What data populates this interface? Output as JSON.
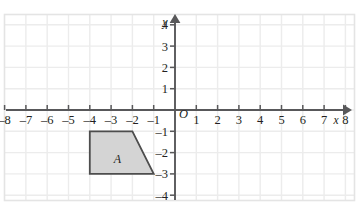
{
  "figure": {
    "type": "coordinate-plane",
    "background_color": "#ffffff",
    "frame_color": "#e2e2e2",
    "grid_color": "#ececec",
    "axis_color": "#58585a",
    "label_color": "#231f20"
  },
  "chart_data": {
    "type": "scatter",
    "title": "",
    "xlabel": "x",
    "ylabel": "y",
    "xlim": [
      -8.6,
      8.6
    ],
    "ylim": [
      -4.6,
      4.6
    ],
    "grid": true,
    "legend": "none",
    "x_ticks": [
      -8,
      -7,
      -6,
      -5,
      -4,
      -3,
      -2,
      -1,
      1,
      2,
      3,
      4,
      5,
      6,
      7,
      8
    ],
    "y_ticks": [
      4,
      3,
      2,
      1,
      -1,
      -2,
      -3,
      -4
    ],
    "x_tick_labels": [
      "–8",
      "–7",
      "–6",
      "–5",
      "–4",
      "–3",
      "–2",
      "–1",
      "1",
      "2",
      "3",
      "4",
      "5",
      "6",
      "7",
      "8"
    ],
    "y_tick_labels": [
      "4",
      "3",
      "2",
      "1",
      "–1",
      "–2",
      "–3",
      "–4"
    ],
    "origin_label": "O",
    "shapes": [
      {
        "name": "A",
        "label": "A",
        "kind": "polygon",
        "vertices": [
          [
            -4,
            -1
          ],
          [
            -2,
            -1
          ],
          [
            -1,
            -3
          ],
          [
            -4,
            -3
          ]
        ],
        "fill": "#d4d4d4",
        "stroke": "#4d4d4d",
        "label_position": [
          -2.7,
          -2.3
        ]
      }
    ]
  },
  "axes": {
    "x_axis_label": "x",
    "y_axis_label": "y",
    "origin_label": "O"
  }
}
